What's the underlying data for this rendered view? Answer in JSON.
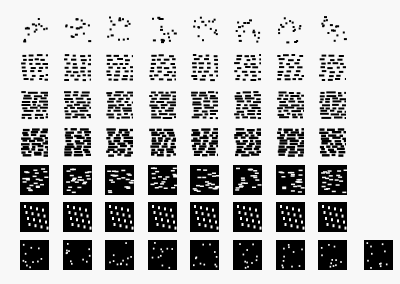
{
  "figure": {
    "rows": 7,
    "columns": 8,
    "last_row_columns": 9,
    "ink_color": "#000000",
    "paper_color": "#f8f8f8",
    "row_densities": [
      0.12,
      0.25,
      0.4,
      0.55,
      0.68,
      0.8,
      0.9
    ],
    "row_patterns": [
      "sparse-dots",
      "short-dashes",
      "wavy-dashes",
      "dense-dashes",
      "brick",
      "diagonal-holes",
      "sparse-holes"
    ]
  }
}
